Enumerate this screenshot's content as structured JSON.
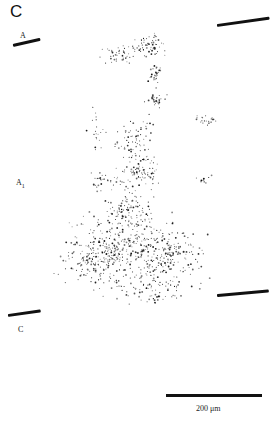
{
  "figure": {
    "panel_letter": "C",
    "layer_labels": [
      {
        "id": "A",
        "text": "A",
        "sub": ""
      },
      {
        "id": "A1",
        "text": "A",
        "sub": "1"
      },
      {
        "id": "C",
        "text": "C",
        "sub": ""
      }
    ],
    "boundary_lines": [
      {
        "name": "left-upper-boundary",
        "x": 13,
        "y": 46,
        "length": 28,
        "angle": -13
      },
      {
        "name": "right-upper-boundary",
        "x": 217,
        "y": 25,
        "length": 53,
        "angle": -8
      },
      {
        "name": "left-lower-boundary",
        "x": 8,
        "y": 315,
        "length": 33,
        "angle": -8
      },
      {
        "name": "right-lower-boundary",
        "x": 217,
        "y": 295,
        "length": 52,
        "angle": -5
      }
    ],
    "scale_bar": {
      "label": "200 μm",
      "length_px": 96
    },
    "colors": {
      "ink": "#111111",
      "background": "#ffffff"
    }
  }
}
